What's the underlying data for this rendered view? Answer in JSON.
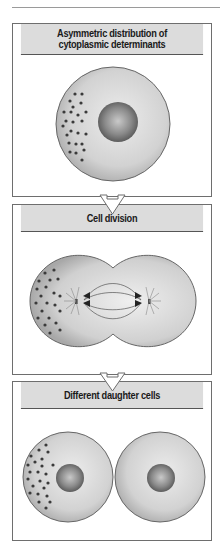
{
  "figure": {
    "panels": [
      {
        "id": "panel-1",
        "title_lines": [
          "Asymmetric distribution of",
          "cytoplasmic determinants"
        ]
      },
      {
        "id": "panel-2",
        "title_lines": [
          "Cell division"
        ]
      },
      {
        "id": "panel-3",
        "title_lines": [
          "Different daughter cells"
        ]
      }
    ],
    "colors": {
      "panel_border": "#6e6e6e",
      "header_fill": "#dcdcdc",
      "cell_fill": "#cfcfcf",
      "nucleus_fill": "#7d7d7d",
      "determinant_dots": "#3a3a3a"
    }
  }
}
